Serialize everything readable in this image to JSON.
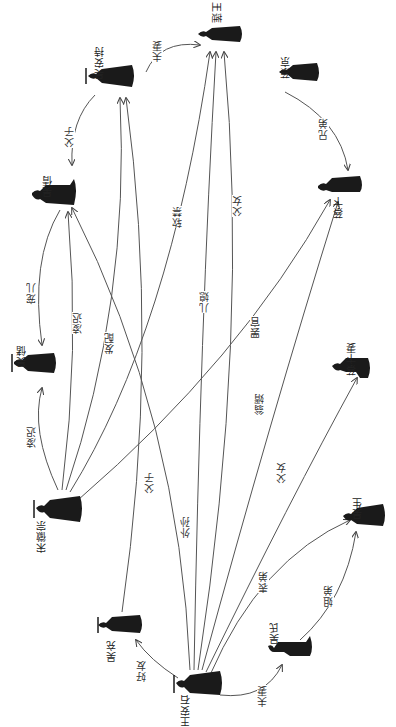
{
  "diagram": {
    "nodes": [
      {
        "id": "wanglian",
        "name": "王莲",
        "x": 218,
        "y": 38
      },
      {
        "id": "wuanchi",
        "name": "吴安持",
        "x": 108,
        "y": 80
      },
      {
        "id": "caijing",
        "name": "蔡京",
        "x": 297,
        "y": 74
      },
      {
        "id": "wuxiu",
        "name": "吴倩",
        "x": 50,
        "y": 195
      },
      {
        "id": "caibian",
        "name": "蔡卞",
        "x": 340,
        "y": 188
      },
      {
        "id": "wushu",
        "name": "吴储",
        "x": 28,
        "y": 365
      },
      {
        "id": "caibianqi",
        "name": "蔡卞妻",
        "x": 360,
        "y": 365
      },
      {
        "id": "songhuizong",
        "name": "宋徽宗",
        "x": 50,
        "y": 510
      },
      {
        "id": "wusheng",
        "name": "吴生",
        "x": 363,
        "y": 515
      },
      {
        "id": "wuchong",
        "name": "吴充",
        "x": 118,
        "y": 625
      },
      {
        "id": "wushi",
        "name": "吴氏",
        "x": 292,
        "y": 650
      },
      {
        "id": "wanganshi",
        "name": "王安石",
        "x": 193,
        "y": 685
      }
    ],
    "edges": [
      {
        "label": "夫妻",
        "from": "wuanchi",
        "to": "wanglian"
      },
      {
        "label": "兄弟",
        "from": "caijing",
        "to": "caibian"
      },
      {
        "label": "父子",
        "from": "wuanchi",
        "to": "wuxiu"
      },
      {
        "label": "宠儿",
        "from": "wuxiu",
        "to": "wushu"
      },
      {
        "label": "凌迟",
        "from": "songhuizong",
        "to": "wushu"
      },
      {
        "label": "凌迟",
        "from": "songhuizong",
        "to": "wuxiu"
      },
      {
        "label": "发配",
        "from": "songhuizong",
        "to": "wuanchi"
      },
      {
        "label": "软禁",
        "from": "songhuizong",
        "to": "wanglian"
      },
      {
        "label": "罢官",
        "from": "songhuizong",
        "to": "caibian"
      },
      {
        "label": "父子",
        "from": "wuchong",
        "to": "wuanchi"
      },
      {
        "label": "外孙",
        "from": "wanganshi",
        "to": "wuxiu"
      },
      {
        "label": "儿媳",
        "from": "wanganshi",
        "to": "wanglian"
      },
      {
        "label": "父女",
        "from": "wanganshi",
        "to": "wanglian"
      },
      {
        "label": "翁婿",
        "from": "wanganshi",
        "to": "caibian"
      },
      {
        "label": "父女",
        "from": "wanganshi",
        "to": "caibianqi"
      },
      {
        "label": "表弟",
        "from": "wanganshi",
        "to": "wusheng"
      },
      {
        "label": "好友",
        "from": "wanganshi",
        "to": "wuchong"
      },
      {
        "label": "夫妻",
        "from": "wanganshi",
        "to": "wushi"
      },
      {
        "label": "姐弟",
        "from": "wushi",
        "to": "wusheng"
      }
    ],
    "colors": {
      "line": "#555555",
      "figure": "#1a1a1a",
      "text": "#333333",
      "background": "#ffffff"
    }
  }
}
